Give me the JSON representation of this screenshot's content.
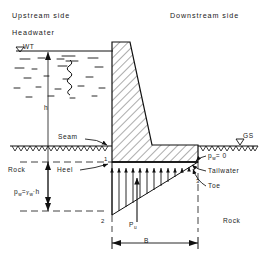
{
  "diagram": {
    "title_upstream": "Upstream side",
    "title_downstream": "Downstream side",
    "headwater_label": "Headwater",
    "wt_label": "WT",
    "gs_label": "GS",
    "height_label": "h",
    "seam_label": "Seam",
    "rock_left_label": "Rock",
    "rock_right_label": "Rock",
    "heel_label": "Heel",
    "toe_label": "Toe",
    "tailwater_label": "Tailwater",
    "pressure_zero_label": "p",
    "pressure_zero_sub": "w",
    "pressure_zero_rest": "= 0",
    "pressure_formula_p": "p",
    "pressure_formula_psub": "w",
    "pressure_formula_eq": "=",
    "pressure_formula_gamma": "γ",
    "pressure_formula_gsub": "w",
    "pressure_formula_tail": "·h",
    "uplift_label_p": "P",
    "uplift_label_sub": "u",
    "base_width_label": "B",
    "node_1": "1",
    "node_2": "2",
    "node_3": "3",
    "colors": {
      "ink": "#1a1a1a",
      "line": "#000000",
      "background": "#ffffff"
    }
  }
}
